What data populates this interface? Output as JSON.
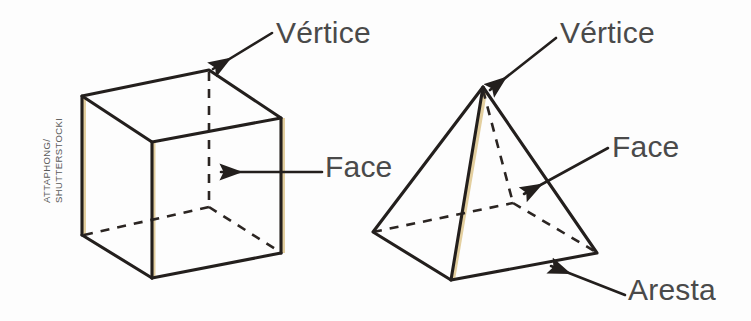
{
  "figure": {
    "background_color": "#fdfdfd",
    "width": 751,
    "height": 321,
    "ink_color": "#231f1d",
    "label_color": "#4a4a4a",
    "credit_color": "#5a5a5a",
    "highlight_color": "#e8d9b8"
  },
  "credit": {
    "name": "image-credit",
    "line1": "ATTAPHONG/",
    "line2": "SHUTTERSTOCKI",
    "text": "ATTAPHONG/\nSHUTTERSTOCKI"
  },
  "labels": {
    "vertice_cube": "Vértice",
    "face_cube": "Face",
    "vertice_pyramid": "Vértice",
    "face_pyramid": "Face",
    "aresta_pyramid": "Aresta"
  },
  "shapes": [
    {
      "name": "cube",
      "kind": "hexahedron",
      "visible_vertices": 7,
      "hidden_vertices": 1,
      "points": {
        "top_back_left": [
          82,
          96
        ],
        "top_back": [
          209,
          70
        ],
        "top_right": [
          281,
          118
        ],
        "top_front": [
          152,
          142
        ],
        "bottom_back_left": [
          82,
          235
        ],
        "bottom_front": [
          152,
          278
        ],
        "bottom_right": [
          281,
          253
        ],
        "bottom_back_hidden": [
          209,
          207
        ]
      },
      "solid_edges": [
        [
          "top_back_left",
          "top_back"
        ],
        [
          "top_back",
          "top_right"
        ],
        [
          "top_right",
          "top_front"
        ],
        [
          "top_front",
          "top_back_left"
        ],
        [
          "top_back_left",
          "bottom_back_left"
        ],
        [
          "top_front",
          "bottom_front"
        ],
        [
          "top_right",
          "bottom_right"
        ],
        [
          "bottom_back_left",
          "bottom_front"
        ],
        [
          "bottom_front",
          "bottom_right"
        ]
      ],
      "dashed_edges": [
        [
          "top_back",
          "bottom_back_hidden"
        ],
        [
          "bottom_back_left",
          "bottom_back_hidden"
        ],
        [
          "bottom_back_hidden",
          "bottom_right"
        ]
      ]
    },
    {
      "name": "pyramid",
      "kind": "square-based-pyramid",
      "visible_vertices": 4,
      "hidden_vertices": 1,
      "points": {
        "apex": [
          483,
          87
        ],
        "base_left": [
          373,
          232
        ],
        "base_front": [
          451,
          280
        ],
        "base_right": [
          597,
          253
        ],
        "base_back_hidden": [
          513,
          203
        ]
      },
      "solid_edges": [
        [
          "apex",
          "base_left"
        ],
        [
          "apex",
          "base_front"
        ],
        [
          "apex",
          "base_right"
        ],
        [
          "base_left",
          "base_front"
        ],
        [
          "base_front",
          "base_right"
        ]
      ],
      "dashed_edges": [
        [
          "apex",
          "base_back_hidden"
        ],
        [
          "base_left",
          "base_back_hidden"
        ],
        [
          "base_back_hidden",
          "base_right"
        ]
      ]
    }
  ],
  "annotations": [
    {
      "name": "leader-vertice-cube",
      "label": "Vértice",
      "target": [
        209,
        70
      ],
      "from": [
        272,
        33
      ],
      "arrow": true
    },
    {
      "name": "leader-face-cube",
      "label": "Face",
      "target": [
        219,
        172
      ],
      "from": [
        322,
        172
      ],
      "arrow": true
    },
    {
      "name": "leader-vertice-pyramid",
      "label": "Vértice",
      "target": [
        487,
        89
      ],
      "from": [
        556,
        38
      ],
      "arrow": true
    },
    {
      "name": "leader-face-pyramid",
      "label": "Face",
      "target": [
        521,
        196
      ],
      "from": [
        608,
        148
      ],
      "arrow": true
    },
    {
      "name": "leader-aresta-pyramid",
      "label": "Aresta",
      "target": [
        548,
        268
      ],
      "from": [
        625,
        295
      ],
      "arrow": true
    }
  ]
}
